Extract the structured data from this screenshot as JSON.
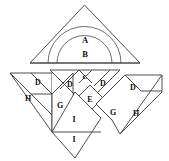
{
  "figure": {
    "background_color": "#ffffff",
    "stroke_color": "#3a3a3a",
    "label_color": "#111111",
    "width": 169,
    "height": 161
  },
  "top_assembly": {
    "name": "triangle-with-arcs",
    "triangle": {
      "apex_x": 84.5,
      "apex_y": 5,
      "left_x": 30,
      "right_x": 140,
      "base_y": 63
    },
    "arcs": [
      {
        "label": "A",
        "radius": 36.5,
        "label_x": 85,
        "label_y": 40
      },
      {
        "label": "B",
        "radius": 27.5,
        "label_x": 85,
        "label_y": 54
      }
    ]
  },
  "bottom_assembly": {
    "name": "diamond-dissection",
    "pieces": [
      {
        "label": "D",
        "label_x": 38,
        "label_y": 83,
        "group": "left-outer"
      },
      {
        "label": "H",
        "label_x": 28,
        "label_y": 99,
        "group": "left-outer"
      },
      {
        "label": "G",
        "label_x": 60,
        "label_y": 106,
        "group": "left-inner"
      },
      {
        "label": "D",
        "label_x": 70,
        "label_y": 85,
        "group": "center-left"
      },
      {
        "label": "C",
        "label_x": 85,
        "label_y": 77,
        "group": "center-top"
      },
      {
        "label": "D",
        "label_x": 103,
        "label_y": 84,
        "group": "center-right"
      },
      {
        "label": "E",
        "label_x": 90,
        "label_y": 100,
        "group": "center-mid"
      },
      {
        "label": "I",
        "label_x": 74,
        "label_y": 120,
        "group": "bottom-diamond"
      },
      {
        "label": "I",
        "label_x": 74,
        "label_y": 140,
        "group": "bottom-diamond"
      },
      {
        "label": "D",
        "label_x": 133,
        "label_y": 88,
        "group": "right-outer"
      },
      {
        "label": "G",
        "label_x": 113,
        "label_y": 113,
        "group": "right-inner"
      },
      {
        "label": "H",
        "label_x": 136,
        "label_y": 114,
        "group": "right-outer"
      }
    ]
  }
}
